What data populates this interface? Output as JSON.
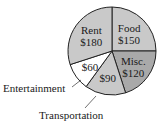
{
  "chart_data": {
    "type": "pie",
    "title": "",
    "categories": [
      "Food",
      "Misc.",
      "Transportation",
      "Entertainment",
      "Rent"
    ],
    "values": [
      150,
      120,
      90,
      60,
      180
    ],
    "value_labels": [
      "$150",
      "$120",
      "$90",
      "$60",
      "$180"
    ],
    "colors": [
      "#c9c9c9",
      "#a9a9a9",
      "#c9c9c9",
      "#ffffff",
      "#c9c9c9"
    ],
    "start_angle_deg": 0,
    "direction": "clockwise",
    "callout_labels": [
      "Entertainment",
      "Transportation"
    ],
    "legend": "none"
  }
}
